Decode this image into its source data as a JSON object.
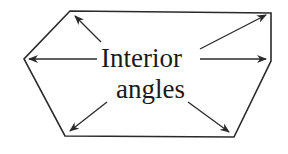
{
  "diagram": {
    "label_line1": "Interior",
    "label_line2": "angles",
    "stroke_color": "#2a2a2a",
    "shape": "hexagon",
    "vertices": [
      {
        "name": "top-left",
        "x": 70,
        "y": 11
      },
      {
        "name": "top-right",
        "x": 271,
        "y": 13
      },
      {
        "name": "right",
        "x": 271,
        "y": 61
      },
      {
        "name": "bottom-right",
        "x": 234,
        "y": 137
      },
      {
        "name": "bottom-left",
        "x": 65,
        "y": 136
      },
      {
        "name": "left",
        "x": 24,
        "y": 59
      }
    ],
    "arrows": [
      {
        "target": "top-left",
        "from": [
          101,
          42
        ],
        "to": [
          75,
          16
        ]
      },
      {
        "target": "top-right",
        "from": [
          200,
          49
        ],
        "to": [
          266,
          15
        ]
      },
      {
        "target": "left",
        "from": [
          97,
          59
        ],
        "to": [
          29,
          59
        ]
      },
      {
        "target": "right",
        "from": [
          200,
          59
        ],
        "to": [
          266,
          59
        ]
      },
      {
        "target": "bottom-left",
        "from": [
          107,
          102
        ],
        "to": [
          70,
          131
        ]
      },
      {
        "target": "bottom-right",
        "from": [
          188,
          102
        ],
        "to": [
          229,
          132
        ]
      }
    ]
  }
}
